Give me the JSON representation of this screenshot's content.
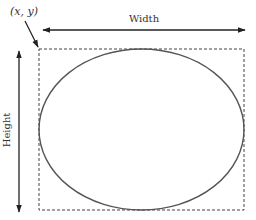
{
  "diagram": {
    "origin_label": "(x, y)",
    "width_label": "Width",
    "height_label": "Height",
    "colors": {
      "stroke": "#222222",
      "ellipse": "#555555",
      "dashed": "#444444",
      "text": "#333333"
    }
  }
}
